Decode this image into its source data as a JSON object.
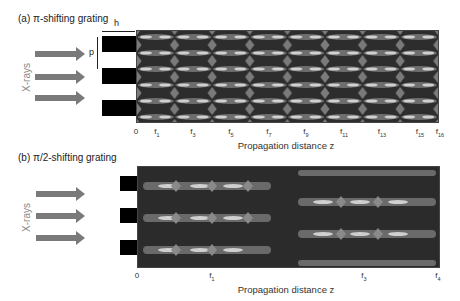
{
  "panel_a": {
    "title": "(a) π-shifting grating",
    "side_label": "X-rays",
    "dim_h": "h",
    "dim_p": "p",
    "xlabel": "Propagation distance z",
    "ticks": [
      {
        "base": "0",
        "sub": "",
        "x": 136
      },
      {
        "base": "f",
        "sub": "1",
        "x": 157
      },
      {
        "base": "f",
        "sub": "3",
        "x": 193
      },
      {
        "base": "f",
        "sub": "5",
        "x": 231
      },
      {
        "base": "f",
        "sub": "7",
        "x": 269
      },
      {
        "base": "f",
        "sub": "9",
        "x": 306
      },
      {
        "base": "f",
        "sub": "11",
        "x": 344
      },
      {
        "base": "f",
        "sub": "13",
        "x": 382
      },
      {
        "base": "f",
        "sub": "15",
        "x": 420
      },
      {
        "base": "f",
        "sub": "16",
        "x": 439
      }
    ]
  },
  "panel_b": {
    "title": "(b) π/2-shifting grating",
    "side_label": "X-rays",
    "xlabel": "Propagation distance z",
    "ticks": [
      {
        "base": "0",
        "sub": "",
        "x": 137
      },
      {
        "base": "f",
        "sub": "1",
        "x": 212
      },
      {
        "base": "f",
        "sub": "3",
        "x": 363
      },
      {
        "base": "f",
        "sub": "4",
        "x": 438
      }
    ]
  },
  "colors": {
    "arrow": "#7a7a7a",
    "grating": "#000000",
    "plot_bg": "#2b2b2b",
    "fringe_bright": "#d8d8d8",
    "fringe_mid": "#7c7c7c"
  }
}
